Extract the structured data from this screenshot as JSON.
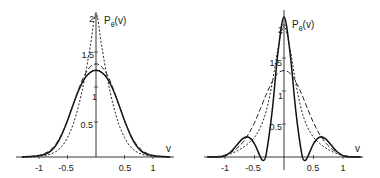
{
  "chart_data": [
    {
      "type": "line",
      "title": "",
      "ylabel": "P_θ(v)",
      "xlabel": "v",
      "xlim": [
        -1.3,
        1.3
      ],
      "ylim": [
        0,
        2.15
      ],
      "x_ticks": [
        "-1",
        "-0.5",
        "0.5",
        "1"
      ],
      "x_tick_values": [
        -1,
        -0.5,
        0.5,
        1
      ],
      "y_ticks": [
        "0.5",
        "1",
        "1.5",
        "2"
      ],
      "y_tick_values": [
        0.5,
        1,
        1.5,
        2
      ],
      "grid": false,
      "legend": "none",
      "series": [
        {
          "name": "solid",
          "style": "solid",
          "x": [
            -1.3,
            -1.1,
            -1.0,
            -0.9,
            -0.8,
            -0.7,
            -0.6,
            -0.5,
            -0.4,
            -0.3,
            -0.2,
            -0.1,
            0,
            0.1,
            0.2,
            0.3,
            0.4,
            0.5,
            0.6,
            0.7,
            0.8,
            0.9,
            1.0,
            1.1,
            1.3
          ],
          "values": [
            0.0,
            0.01,
            0.02,
            0.04,
            0.08,
            0.17,
            0.32,
            0.52,
            0.75,
            0.96,
            1.12,
            1.21,
            1.24,
            1.21,
            1.12,
            0.96,
            0.75,
            0.52,
            0.32,
            0.17,
            0.08,
            0.04,
            0.02,
            0.01,
            0.0
          ]
        },
        {
          "name": "dashed",
          "style": "dashed",
          "x": [
            -1.3,
            -1.1,
            -1.0,
            -0.9,
            -0.8,
            -0.7,
            -0.6,
            -0.5,
            -0.4,
            -0.3,
            -0.2,
            -0.1,
            0,
            0.1,
            0.2,
            0.3,
            0.4,
            0.5,
            0.6,
            0.7,
            0.8,
            0.9,
            1.0,
            1.1,
            1.3
          ],
          "values": [
            0.0,
            0.01,
            0.02,
            0.05,
            0.1,
            0.19,
            0.33,
            0.52,
            0.75,
            0.98,
            1.17,
            1.29,
            1.33,
            1.29,
            1.17,
            0.98,
            0.75,
            0.52,
            0.33,
            0.19,
            0.1,
            0.05,
            0.02,
            0.01,
            0.0
          ]
        },
        {
          "name": "dotted",
          "style": "dotted",
          "x": [
            -1.3,
            -1.1,
            -1.0,
            -0.9,
            -0.8,
            -0.7,
            -0.6,
            -0.5,
            -0.4,
            -0.3,
            -0.2,
            -0.1,
            0,
            0.1,
            0.2,
            0.3,
            0.4,
            0.5,
            0.6,
            0.7,
            0.8,
            0.9,
            1.0,
            1.1,
            1.3
          ],
          "values": [
            0.0,
            0.0,
            0.01,
            0.02,
            0.04,
            0.08,
            0.15,
            0.28,
            0.47,
            0.75,
            1.12,
            1.58,
            2.05,
            1.58,
            1.12,
            0.75,
            0.47,
            0.28,
            0.15,
            0.08,
            0.04,
            0.02,
            0.01,
            0.0,
            0.0
          ]
        }
      ]
    },
    {
      "type": "line",
      "title": "",
      "ylabel": "P_θ(v)",
      "xlabel": "v",
      "xlim": [
        -1.3,
        1.3
      ],
      "ylim": [
        -0.1,
        2.2
      ],
      "x_ticks": [
        "-1",
        "-0.5",
        "0.5",
        "1"
      ],
      "x_tick_values": [
        -1,
        -0.5,
        0.5,
        1
      ],
      "y_ticks": [
        "0.5",
        "1",
        "1.5",
        "2"
      ],
      "y_tick_values": [
        0.5,
        1,
        1.5,
        2
      ],
      "grid": false,
      "legend": "none",
      "series": [
        {
          "name": "solid",
          "style": "solid",
          "x": [
            -1.3,
            -1.1,
            -1.0,
            -0.9,
            -0.8,
            -0.7,
            -0.6,
            -0.5,
            -0.4,
            -0.35,
            -0.3,
            -0.2,
            -0.1,
            0,
            0.1,
            0.2,
            0.3,
            0.35,
            0.4,
            0.5,
            0.6,
            0.7,
            0.8,
            0.9,
            1.0,
            1.1,
            1.3
          ],
          "values": [
            0.0,
            0.0,
            0.02,
            0.08,
            0.18,
            0.28,
            0.3,
            0.2,
            0.0,
            -0.05,
            0.05,
            0.7,
            1.6,
            2.12,
            1.6,
            0.7,
            0.05,
            -0.05,
            0.0,
            0.2,
            0.3,
            0.28,
            0.18,
            0.08,
            0.02,
            0.0,
            0.0
          ]
        },
        {
          "name": "dashed",
          "style": "dashed",
          "x": [
            -1.3,
            -1.1,
            -1.0,
            -0.9,
            -0.8,
            -0.7,
            -0.6,
            -0.5,
            -0.4,
            -0.3,
            -0.2,
            -0.1,
            0,
            0.1,
            0.2,
            0.3,
            0.4,
            0.5,
            0.6,
            0.7,
            0.8,
            0.9,
            1.0,
            1.1,
            1.3
          ],
          "values": [
            0.0,
            0.01,
            0.03,
            0.07,
            0.13,
            0.22,
            0.35,
            0.52,
            0.73,
            0.95,
            1.14,
            1.27,
            1.31,
            1.27,
            1.14,
            0.95,
            0.73,
            0.52,
            0.35,
            0.22,
            0.13,
            0.07,
            0.03,
            0.01,
            0.0
          ]
        },
        {
          "name": "dotted",
          "style": "dotted",
          "x": [
            -1.3,
            -1.1,
            -1.0,
            -0.9,
            -0.8,
            -0.7,
            -0.6,
            -0.5,
            -0.4,
            -0.3,
            -0.2,
            -0.1,
            0,
            0.1,
            0.2,
            0.3,
            0.4,
            0.5,
            0.6,
            0.7,
            0.8,
            0.9,
            1.0,
            1.1,
            1.3
          ],
          "values": [
            0.0,
            0.01,
            0.02,
            0.05,
            0.09,
            0.14,
            0.21,
            0.3,
            0.45,
            0.7,
            1.12,
            1.65,
            1.98,
            1.65,
            1.12,
            0.7,
            0.45,
            0.3,
            0.21,
            0.14,
            0.09,
            0.05,
            0.02,
            0.01,
            0.0
          ]
        }
      ]
    }
  ],
  "panels": [
    {
      "ylabel_main": "P",
      "ylabel_sub": "θ",
      "ylabel_tail": "(v)",
      "xlabel": "v",
      "x_ticks": [
        "-1",
        "-0.5",
        "0.5",
        "1"
      ],
      "y_ticks": [
        "0.5",
        "1",
        "1.5",
        "2"
      ]
    },
    {
      "ylabel_main": "P",
      "ylabel_sub": "θ",
      "ylabel_tail": "(v)",
      "xlabel": "v",
      "x_ticks": [
        "-1",
        "-0.5",
        "0.5",
        "1"
      ],
      "y_ticks": [
        "0.5",
        "1",
        "1.5",
        "2"
      ]
    }
  ]
}
